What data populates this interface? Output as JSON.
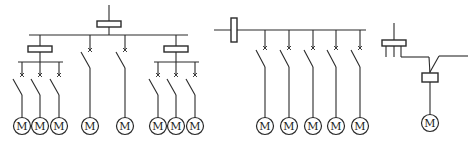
{
  "diagram": {
    "title": "",
    "type": "motor power distribution single-line diagrams",
    "colors": {
      "line": "#2a2a2a",
      "background": "#ffffff"
    },
    "motor_label": "M",
    "groups": [
      {
        "name": "radial-with-sub-distribution",
        "description": "Main feed through distribution box to bus; two sub-boxes each feeding 3 motors; two direct motor feeders",
        "motor_count": 8,
        "motors": [
          "M",
          "M",
          "M",
          "M",
          "M",
          "M",
          "M",
          "M"
        ]
      },
      {
        "name": "busbar-trunk",
        "description": "Horizontal trunk with inline box feeding 5 motor branches via switches",
        "motor_count": 5,
        "motors": [
          "M",
          "M",
          "M",
          "M",
          "M"
        ]
      },
      {
        "name": "chain-connection",
        "description": "Box with tapped connection feeding a second box to one motor",
        "motor_count": 1,
        "motors": [
          "M"
        ]
      }
    ]
  }
}
